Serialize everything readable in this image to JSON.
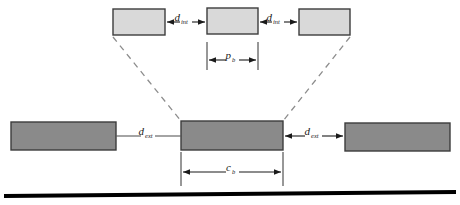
{
  "figure": {
    "background_color": "#ffffff",
    "ground_line_color": "#000000"
  },
  "colors": {
    "projected_block_fill": "#d9d9d9",
    "projected_block_stroke": "#3c3c3c",
    "actual_block_fill": "#8a8a8a",
    "actual_block_stroke": "#3c3c3c",
    "dashed_line": "#8c8c8c",
    "dimension_line": "#1a1a1a",
    "text": "#1a1a1a"
  },
  "projected_row": {
    "name": "projected blocks row",
    "blocks": [
      {
        "id": "projected-block-left",
        "x": 113,
        "y": 9,
        "width": 52,
        "height": 26
      },
      {
        "id": "projected-block-center",
        "x": 207,
        "y": 8,
        "width": 51,
        "height": 26
      },
      {
        "id": "projected-block-right",
        "x": 299,
        "y": 9,
        "width": 51,
        "height": 26
      }
    ],
    "gap_labels": [
      {
        "id": "d-int-left",
        "symbol": "d",
        "subscript": "int",
        "x": 186,
        "y": 19
      },
      {
        "id": "d-int-right",
        "symbol": "d",
        "subscript": "int",
        "x": 278,
        "y": 19
      }
    ]
  },
  "actual_row": {
    "name": "actual blocks row",
    "blocks": [
      {
        "id": "actual-block-left",
        "x": 11,
        "y": 122,
        "width": 105,
        "height": 28
      },
      {
        "id": "actual-block-center",
        "x": 181,
        "y": 121,
        "width": 102,
        "height": 29
      },
      {
        "id": "actual-block-right",
        "x": 345,
        "y": 123,
        "width": 105,
        "height": 28
      }
    ],
    "gap_labels": [
      {
        "id": "d-ext-left",
        "symbol": "d",
        "subscript": "ext",
        "x": 148,
        "y": 134
      },
      {
        "id": "d-ext-right",
        "symbol": "d",
        "subscript": "ext",
        "x": 313,
        "y": 134
      }
    ]
  },
  "dimensions": [
    {
      "id": "pitch-dimension",
      "symbol": "p",
      "subscript": "b",
      "label_x": 232,
      "label_y": 58,
      "line_y": 60,
      "x_start": 207,
      "x_end": 258,
      "tick_top": 42,
      "tick_bottom": 70
    },
    {
      "id": "chord-dimension",
      "symbol": "c",
      "subscript": "b",
      "label_x": 232,
      "label_y": 170,
      "line_y": 172,
      "x_start": 181,
      "x_end": 283,
      "tick_top": 152,
      "tick_bottom": 186
    }
  ],
  "projection_lines": [
    {
      "id": "projection-line-left",
      "x1": 113,
      "y1": 37,
      "x2": 181,
      "y2": 121
    },
    {
      "id": "projection-line-right",
      "x1": 350,
      "y1": 37,
      "x2": 283,
      "y2": 121
    }
  ],
  "ground_line": {
    "id": "ground-line",
    "x1": 4,
    "y1": 196,
    "x2": 456,
    "y2": 192,
    "thickness": 4
  }
}
